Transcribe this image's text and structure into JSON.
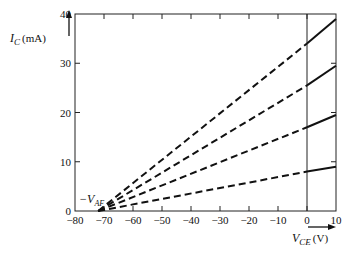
{
  "chart_data": {
    "type": "line",
    "title": "",
    "xlabel": "V_CE (V)",
    "ylabel": "I_C (mA)",
    "xlim": [
      -80,
      10
    ],
    "ylim": [
      0,
      40
    ],
    "x_ticks": [
      -80,
      -70,
      -60,
      -50,
      -40,
      -30,
      -20,
      -10,
      0,
      10
    ],
    "y_ticks": [
      0,
      10,
      20,
      30,
      40
    ],
    "grid": false,
    "annotations": [
      {
        "text": "-V_AF",
        "x": -72,
        "y": 0,
        "note": "Early voltage intercept where extrapolated lines meet"
      }
    ],
    "vertical_line": {
      "x": 0
    },
    "intercept_x": -72,
    "series": [
      {
        "name": "curve-1",
        "x": [
          -72,
          0,
          10
        ],
        "values": [
          0,
          34,
          39
        ],
        "dashed_until_x": 0
      },
      {
        "name": "curve-2",
        "x": [
          -72,
          0,
          10
        ],
        "values": [
          0,
          25.5,
          29.5
        ],
        "dashed_until_x": 0
      },
      {
        "name": "curve-3",
        "x": [
          -72,
          0,
          10
        ],
        "values": [
          0,
          17,
          19.5
        ],
        "dashed_until_x": 0
      },
      {
        "name": "curve-4",
        "x": [
          -72,
          0,
          10
        ],
        "values": [
          0,
          8,
          9
        ],
        "dashed_until_x": 0
      }
    ]
  },
  "labels": {
    "y_main": "I",
    "y_sub": "C",
    "y_unit": "(mA)",
    "x_main": "V",
    "x_sub": "CE",
    "x_unit": "(V)",
    "vaf_main": "−V",
    "vaf_sub": "AF"
  },
  "tick_text": {
    "x": [
      "−80",
      "−70",
      "−60",
      "−50",
      "−40",
      "−30",
      "−20",
      "−10",
      "0",
      "10"
    ],
    "y": [
      "0",
      "10",
      "20",
      "30",
      "40"
    ]
  }
}
